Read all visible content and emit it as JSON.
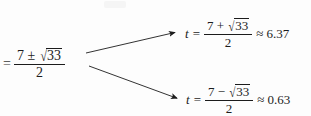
{
  "figure": {
    "kind": "math-branch-diagram",
    "background_color": "#fdfdfd",
    "ink_color": "#1c1c1c"
  },
  "lhs": {
    "equals": "=",
    "numerator": {
      "first_term": "7",
      "operator": "±",
      "radical_sign": "√",
      "radicand": "33"
    },
    "denominator": "2"
  },
  "branches": [
    {
      "id": "positive-root",
      "variable": "t",
      "equals": "=",
      "numerator": {
        "first_term": "7",
        "operator": "+",
        "radical_sign": "√",
        "radicand": "33"
      },
      "denominator": "2",
      "approx_sign": "≈",
      "value": "6.37"
    },
    {
      "id": "negative-root",
      "variable": "t",
      "equals": "=",
      "numerator": {
        "first_term": "7",
        "operator": "−",
        "radical_sign": "√",
        "radicand": "33"
      },
      "denominator": "2",
      "approx_sign": "≈",
      "value": "0.63"
    }
  ],
  "arrows": [
    {
      "id": "arrow-to-positive-root",
      "from_x": 86,
      "from_y": 53,
      "to_x": 177,
      "to_y": 32
    },
    {
      "id": "arrow-to-negative-root",
      "from_x": 89,
      "from_y": 66,
      "to_x": 179,
      "to_y": 99
    }
  ]
}
